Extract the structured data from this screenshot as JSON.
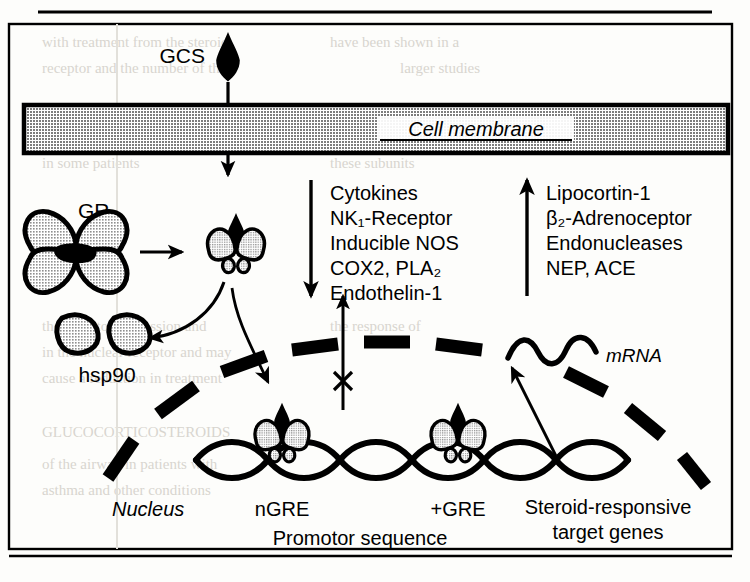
{
  "figure": {
    "title_rule": "",
    "labels": {
      "gcs": "GCS",
      "cell_membrane": "Cell membrane",
      "gr": "GR",
      "hsp90": "hsp90",
      "nucleus": "Nucleus",
      "ngre": "nGRE",
      "pgre": "+GRE",
      "promotor": "Promotor sequence",
      "mrna": "mRNA",
      "target_genes_line1": "Steroid-responsive",
      "target_genes_line2": "target genes"
    },
    "downregulated": {
      "direction": "down",
      "items": [
        "Cytokines",
        "NK₁-Receptor",
        "Inducible NOS",
        "COX2, PLA₂",
        "Endothelin-1"
      ]
    },
    "upregulated": {
      "direction": "up",
      "items": [
        "Lipocortin-1",
        "β₂-Adrenoceptor",
        "Endonucleases",
        "NEP, ACE"
      ]
    },
    "icons": {
      "gcs_ligand": "diamond-icon",
      "receptor": "receptor-icon",
      "hsp90_subunit": "hsp90-subunit-icon",
      "blocked": "x-block-icon",
      "dna": "dna-helix-icon",
      "mrna_strand": "mrna-squiggle-icon",
      "nuclear_envelope": "dashed-envelope-icon"
    },
    "colors": {
      "ink": "#000000",
      "membrane_fill": "#b0b0b0",
      "protein_fill": "#b9b9b9",
      "page": "#fdfdfb",
      "bleed_text": "#d8d5cf"
    },
    "background_bleed": [
      "and",
      "with",
      "the",
      "in",
      "of",
      "are",
      "is",
      "for",
      "that",
      "this",
      "to",
      "on",
      "as",
      "by"
    ]
  }
}
